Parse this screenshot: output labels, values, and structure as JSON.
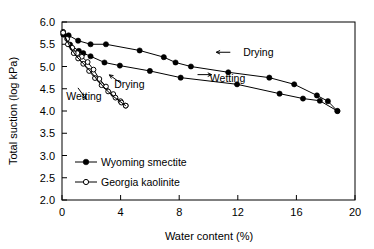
{
  "chart_data": {
    "type": "line",
    "title": "",
    "xlabel": "Water content (%)",
    "ylabel": "Total suction (log kPa)",
    "xlim": [
      0,
      20
    ],
    "ylim": [
      2.0,
      6.0
    ],
    "xticks": [
      "0",
      "4",
      "8",
      "12",
      "16",
      "20"
    ],
    "xtick_values": [
      0,
      4,
      8,
      12,
      16,
      20
    ],
    "yticks": [
      "2.0",
      "2.5",
      "3.0",
      "3.5",
      "4.0",
      "4.5",
      "5.0",
      "5.5",
      "6.0"
    ],
    "ytick_values": [
      2.0,
      2.5,
      3.0,
      3.5,
      4.0,
      4.5,
      5.0,
      5.5,
      6.0
    ],
    "grid": false,
    "legend_position": "lower-left-inside",
    "legend": [
      {
        "label": "Wyoming smectite",
        "marker": "filled-circle"
      },
      {
        "label": "Georgia kaolinite",
        "marker": "open-circle"
      }
    ],
    "series": [
      {
        "name": "Wyoming smectite drying",
        "legend_ref": "Wyoming smectite",
        "marker": "filled-circle",
        "points": [
          [
            0.1,
            5.72
          ],
          [
            0.45,
            5.7
          ],
          [
            1.1,
            5.58
          ],
          [
            1.95,
            5.5
          ],
          [
            3.0,
            5.5
          ],
          [
            5.3,
            5.36
          ],
          [
            6.95,
            5.21
          ],
          [
            7.75,
            5.09
          ],
          [
            8.8,
            5.0
          ],
          [
            11.35,
            4.87
          ],
          [
            14.15,
            4.75
          ],
          [
            15.85,
            4.6
          ],
          [
            17.4,
            4.35
          ],
          [
            18.15,
            4.22
          ],
          [
            18.8,
            4.0
          ]
        ]
      },
      {
        "name": "Wyoming smectite wetting",
        "legend_ref": "Wyoming smectite",
        "marker": "filled-circle",
        "points": [
          [
            0.1,
            5.72
          ],
          [
            0.55,
            5.49
          ],
          [
            1.15,
            5.35
          ],
          [
            1.45,
            5.3
          ],
          [
            1.95,
            5.23
          ],
          [
            2.9,
            5.09
          ],
          [
            3.95,
            5.02
          ],
          [
            6.0,
            4.9
          ],
          [
            8.1,
            4.75
          ],
          [
            11.95,
            4.6
          ],
          [
            14.85,
            4.39
          ],
          [
            16.45,
            4.28
          ],
          [
            17.6,
            4.23
          ],
          [
            18.8,
            4.0
          ]
        ]
      },
      {
        "name": "Georgia kaolinite drying",
        "legend_ref": "Georgia kaolinite",
        "marker": "open-circle",
        "points": [
          [
            0.08,
            5.78
          ],
          [
            0.35,
            5.62
          ],
          [
            0.7,
            5.42
          ],
          [
            1.05,
            5.3
          ],
          [
            1.35,
            5.22
          ],
          [
            1.75,
            5.1
          ],
          [
            2.15,
            4.93
          ],
          [
            2.55,
            4.72
          ],
          [
            3.0,
            4.55
          ],
          [
            3.5,
            4.38
          ],
          [
            4.0,
            4.22
          ],
          [
            4.35,
            4.12
          ]
        ]
      },
      {
        "name": "Georgia kaolinite wetting",
        "legend_ref": "Georgia kaolinite",
        "marker": "open-circle",
        "points": [
          [
            0.08,
            5.76
          ],
          [
            0.4,
            5.5
          ],
          [
            0.8,
            5.3
          ],
          [
            1.1,
            5.18
          ],
          [
            1.45,
            5.06
          ],
          [
            1.85,
            4.9
          ],
          [
            2.25,
            4.74
          ],
          [
            2.7,
            4.58
          ],
          [
            3.15,
            4.44
          ],
          [
            3.65,
            4.3
          ],
          [
            4.05,
            4.19
          ],
          [
            4.35,
            4.12
          ]
        ]
      },
      {
        "name": "Georgia kaolinite inner loop",
        "legend_ref": "Georgia kaolinite",
        "marker": "none",
        "points": [
          [
            0.2,
            5.68
          ],
          [
            0.55,
            5.44
          ],
          [
            0.95,
            5.24
          ],
          [
            1.3,
            5.12
          ],
          [
            1.65,
            5.0
          ],
          [
            2.05,
            4.85
          ],
          [
            2.45,
            4.68
          ],
          [
            2.9,
            4.52
          ],
          [
            3.35,
            4.37
          ],
          [
            3.85,
            4.24
          ],
          [
            4.35,
            4.12
          ]
        ]
      }
    ],
    "annotations": [
      {
        "text": "Drying",
        "x": 13.4,
        "y": 5.23,
        "arrow_dir": "left"
      },
      {
        "text": "Wetting",
        "x": 11.3,
        "y": 4.66,
        "arrow_dir": "right"
      },
      {
        "text": "Drying",
        "x": 4.6,
        "y": 4.52,
        "arrow_dir": "up-left"
      },
      {
        "text": "Wetting",
        "x": 1.5,
        "y": 4.25,
        "arrow_dir": "down-right"
      }
    ]
  },
  "colors": {
    "line": "#000000",
    "marker_fill": "#000000",
    "marker_open": "#ffffff",
    "background": "#ffffff",
    "axis": "#000000"
  }
}
